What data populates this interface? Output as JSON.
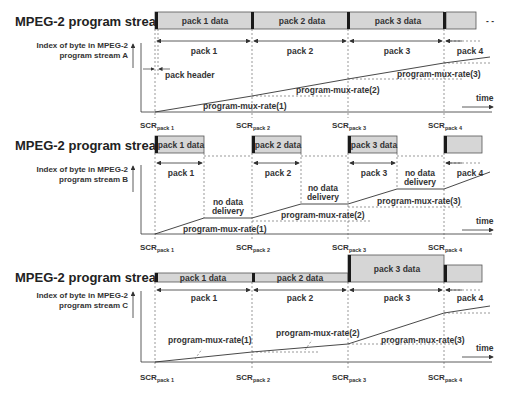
{
  "streams": [
    {
      "title": "MPEG-2 program stream A",
      "ylabel_line1": "Index of byte in MPEG-2",
      "ylabel_line2": "program stream A",
      "data_labels": [
        "pack 1 data",
        "pack 2 data",
        "pack 3 data"
      ],
      "pack_labels": [
        "pack 1",
        "pack 2",
        "pack 3",
        "pack 4"
      ],
      "annotations": {
        "pack_header": "pack header",
        "rate1": "program-mux-rate(1)",
        "rate2": "program-mux-rate(2)",
        "rate3": "program-mux-rate(3)",
        "time": "time"
      },
      "scr": [
        "SCR",
        "SCR",
        "SCR",
        "SCR"
      ],
      "scr_sub": [
        "pack 1",
        "pack 2",
        "pack 3",
        "pack 4"
      ]
    },
    {
      "title": "MPEG-2 program stream B",
      "ylabel_line1": "Index of byte in MPEG-2",
      "ylabel_line2": "program stream B",
      "data_labels": [
        "pack 1 data",
        "pack 2 data",
        "pack 3 data"
      ],
      "pack_labels": [
        "pack 1",
        "pack 2",
        "pack 3",
        "pack 4"
      ],
      "annotations": {
        "no_data_1": "no data",
        "no_data_2": "delivery",
        "rate1": "program-mux-rate(1)",
        "rate2": "program-mux-rate(2)",
        "rate3": "program-mux-rate(3)",
        "time": "time"
      },
      "scr": [
        "SCR",
        "SCR",
        "SCR",
        "SCR"
      ],
      "scr_sub": [
        "pack 1",
        "pack 2",
        "pack 3",
        "pack 4"
      ]
    },
    {
      "title": "MPEG-2 program stream C",
      "ylabel_line1": "Index of byte in MPEG-2",
      "ylabel_line2": "program stream C",
      "data_labels": [
        "pack 1 data",
        "pack 2 data",
        "pack 3 data"
      ],
      "pack_labels": [
        "pack 1",
        "pack 2",
        "pack 3",
        "pack 4"
      ],
      "annotations": {
        "rate1": "program-mux-rate(1)",
        "rate2": "program-mux-rate(2)",
        "rate3": "program-mux-rate(3)",
        "time": "time"
      },
      "scr": [
        "SCR",
        "SCR",
        "SCR",
        "SCR"
      ],
      "scr_sub": [
        "pack 1",
        "pack 2",
        "pack 3",
        "pack 4"
      ]
    }
  ],
  "colors": {
    "bar_fill": "#d6d6d6",
    "header_fill": "#1a1a1a",
    "line": "#333333"
  }
}
